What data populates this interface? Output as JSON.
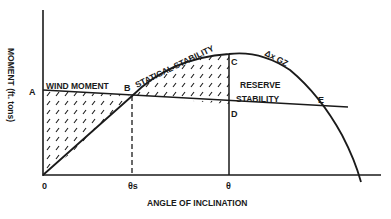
{
  "diagram": {
    "y_axis_label": "MOMENT (ft. tons)",
    "x_axis_label": "ANGLE OF INCLINATION",
    "origin_label": "0",
    "ticks": {
      "theta_s": "θs",
      "theta": "θ"
    },
    "points": {
      "A": "A",
      "B": "B",
      "C": "C",
      "D": "D",
      "E": "E"
    },
    "region_labels": {
      "wind_moment": "WIND MOMENT",
      "statical_stability": "STATICAL STABILITY",
      "reserve_line1": "RESERVE",
      "reserve_line2": "STABILITY",
      "curve": "Δx GZ"
    },
    "colors": {
      "ink": "#1a1a1a",
      "background": "#ffffff"
    }
  }
}
